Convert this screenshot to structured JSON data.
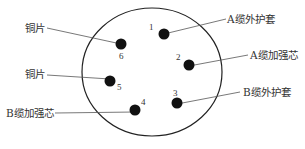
{
  "diagram": {
    "type": "connector-pin-layout",
    "outline": {
      "cx": 152,
      "cy": 72,
      "rx": 70,
      "ry": 64,
      "stroke": "#222222"
    },
    "pins": [
      {
        "id": "1",
        "cx": 164,
        "cy": 34,
        "num_x": 149,
        "num_y": 22
      },
      {
        "id": "2",
        "cx": 189,
        "cy": 65,
        "num_x": 176,
        "num_y": 52
      },
      {
        "id": "3",
        "cx": 177,
        "cy": 103,
        "num_x": 173,
        "num_y": 88
      },
      {
        "id": "4",
        "cx": 135,
        "cy": 110,
        "num_x": 141,
        "num_y": 97
      },
      {
        "id": "5",
        "cx": 110,
        "cy": 81,
        "num_x": 117,
        "num_y": 82
      },
      {
        "id": "6",
        "cx": 121,
        "cy": 44,
        "num_x": 119,
        "num_y": 51
      }
    ],
    "labels": [
      {
        "text": "铜片",
        "x": 25,
        "y": 22,
        "pin": "6",
        "line": [
          47,
          28,
          121,
          44
        ]
      },
      {
        "text": "铜片",
        "x": 25,
        "y": 68,
        "pin": "5",
        "line": [
          47,
          75,
          110,
          79
        ]
      },
      {
        "text": "B缆加强芯",
        "x": 6,
        "y": 107,
        "pin": "4",
        "line": [
          55,
          113,
          135,
          112
        ]
      },
      {
        "text": "A缆外护套",
        "x": 227,
        "y": 13,
        "pin": "1",
        "line": [
          226,
          19,
          164,
          34
        ]
      },
      {
        "text": "A缆加强芯",
        "x": 250,
        "y": 49,
        "pin": "2",
        "line": [
          248,
          55,
          189,
          66
        ]
      },
      {
        "text": "B缆外护套",
        "x": 243,
        "y": 86,
        "pin": "3",
        "line": [
          240,
          92,
          177,
          104
        ]
      }
    ],
    "pin_color": "#111111",
    "line_color": "#555555"
  }
}
